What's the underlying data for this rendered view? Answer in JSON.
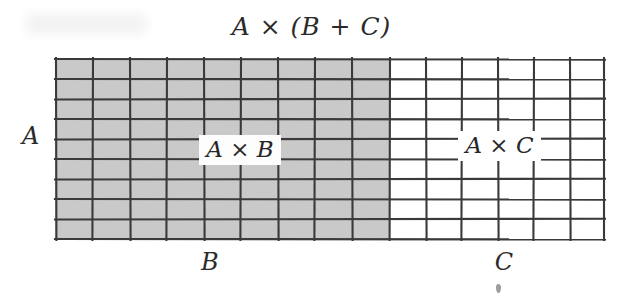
{
  "figure": {
    "title": "A × (B + C)",
    "kind": "distributive-property-area-model",
    "labels": {
      "left_axis": "A",
      "bottom_left": "B",
      "bottom_right": "C",
      "left_region": "A × B",
      "right_region": "A × C"
    },
    "colors": {
      "shaded_fill": "#c9c9c9",
      "unshaded_fill": "#ffffff",
      "grid_line": "#3a3a3a",
      "background": "#ffffff",
      "ink": "#2b2b2b"
    }
  },
  "chart_data": {
    "type": "heatmap",
    "title": "A × (B + C)",
    "xlabel": "",
    "ylabel": "",
    "rows": 9,
    "columns": 15,
    "row_label": "A",
    "column_labels": [
      "B",
      "C"
    ],
    "column_groups": [
      {
        "name": "B",
        "columns": 9,
        "fill": "#c9c9c9",
        "label": "A × B"
      },
      {
        "name": "C",
        "columns": 6,
        "fill": "#ffffff",
        "label": "A × C"
      }
    ],
    "values": [
      [
        1,
        1,
        1,
        1,
        1,
        1,
        1,
        1,
        1,
        0,
        0,
        0,
        0,
        0,
        0
      ],
      [
        1,
        1,
        1,
        1,
        1,
        1,
        1,
        1,
        1,
        0,
        0,
        0,
        0,
        0,
        0
      ],
      [
        1,
        1,
        1,
        1,
        1,
        1,
        1,
        1,
        1,
        0,
        0,
        0,
        0,
        0,
        0
      ],
      [
        1,
        1,
        1,
        1,
        1,
        1,
        1,
        1,
        1,
        0,
        0,
        0,
        0,
        0,
        0
      ],
      [
        1,
        1,
        1,
        1,
        1,
        1,
        1,
        1,
        1,
        0,
        0,
        0,
        0,
        0,
        0
      ],
      [
        1,
        1,
        1,
        1,
        1,
        1,
        1,
        1,
        1,
        0,
        0,
        0,
        0,
        0,
        0
      ],
      [
        1,
        1,
        1,
        1,
        1,
        1,
        1,
        1,
        1,
        0,
        0,
        0,
        0,
        0,
        0
      ],
      [
        1,
        1,
        1,
        1,
        1,
        1,
        1,
        1,
        1,
        0,
        0,
        0,
        0,
        0,
        0
      ],
      [
        1,
        1,
        1,
        1,
        1,
        1,
        1,
        1,
        1,
        0,
        0,
        0,
        0,
        0,
        0
      ]
    ],
    "grid": true,
    "legend": "none",
    "annotations": [
      {
        "text": "A × (B + C)",
        "position": "top-center"
      },
      {
        "text": "A",
        "position": "left-middle"
      },
      {
        "text": "A × B",
        "position": "inside-shaded"
      },
      {
        "text": "A × C",
        "position": "inside-unshaded"
      },
      {
        "text": "B",
        "position": "bottom-shaded"
      },
      {
        "text": "C",
        "position": "bottom-unshaded"
      }
    ]
  }
}
